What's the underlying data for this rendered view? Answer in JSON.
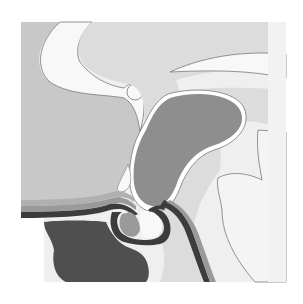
{
  "diagram": {
    "type": "anatomical-cross-section",
    "labels": [],
    "frame": {
      "x": 21,
      "y": 22,
      "width": 265,
      "height": 260
    },
    "colors": {
      "background": "#ffffff",
      "panel_light": "#efefef",
      "region_mid_gray": "#c8c8c8",
      "region_light_gray": "#dcdcdc",
      "region_white": "#f8f8f8",
      "gland_dark": "#8e8e8e",
      "bone_dark": "#4f4f4f",
      "outline": "#7a7a7a",
      "band_dark": "#3c3c3c",
      "band_mid": "#9a9a9a"
    }
  }
}
